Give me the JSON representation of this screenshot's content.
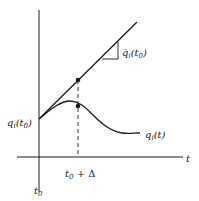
{
  "figure": {
    "axes": {
      "x_label": "t",
      "x_ticks": [
        {
          "label_main": "t",
          "label_sub": "0",
          "label_suffix": ""
        },
        {
          "label_main": "t",
          "label_sub": "0",
          "label_suffix": " + Δ"
        }
      ]
    },
    "labels": {
      "initial_value": {
        "main": "q",
        "sub": "i",
        "paren_open": "(t",
        "paren_sub": "0",
        "paren_close": ")"
      },
      "curve": {
        "main": "q",
        "sub": "i",
        "rest": "(t)"
      },
      "slope": {
        "main": "q̇",
        "sub": "i",
        "paren_open": "(t",
        "paren_sub": "0",
        "paren_close": ")"
      }
    },
    "colors": {
      "line": "#1a1a1a",
      "background": "#ffffff"
    },
    "elements": [
      "vertical-axis",
      "horizontal-axis",
      "tangent-line",
      "trajectory-curve",
      "dashed-guide",
      "tangent-point",
      "curve-point",
      "slope-triangle"
    ]
  }
}
